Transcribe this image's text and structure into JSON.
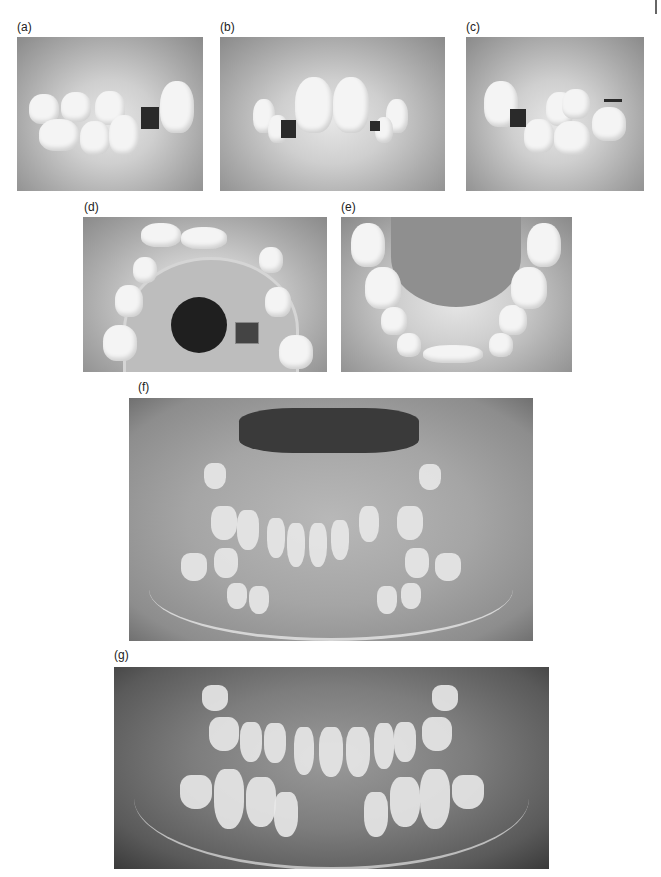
{
  "figure": {
    "panels": [
      {
        "id": "a",
        "label": "(a)",
        "description": "intraoral photo, right lateral view in occlusion"
      },
      {
        "id": "b",
        "label": "(b)",
        "description": "intraoral photo, frontal view in occlusion"
      },
      {
        "id": "c",
        "label": "(c)",
        "description": "intraoral photo, left lateral view in occlusion"
      },
      {
        "id": "d",
        "label": "(d)",
        "description": "maxillary occlusal view with removable appliance"
      },
      {
        "id": "e",
        "label": "(e)",
        "description": "mandibular occlusal view"
      },
      {
        "id": "f",
        "label": "(f)",
        "description": "panoramic radiograph, mixed dentition"
      },
      {
        "id": "g",
        "label": "(g)",
        "description": "panoramic radiograph, later stage"
      }
    ]
  }
}
